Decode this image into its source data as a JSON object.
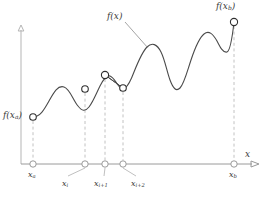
{
  "figure": {
    "name": "function-sampling-diagram",
    "background": "#ffffff",
    "curve_color": "#4a4a4a",
    "axis_color": "#9a9a9a",
    "dash_color": "#c2c2c2",
    "label_color": "#3a3a3a",
    "marker_fill": "#ffffff"
  },
  "axes": {
    "x_axis_label": "x",
    "y_axis_label": "",
    "x_axis_y": 164,
    "y_axis_x": 21,
    "x_axis_from": 21,
    "x_axis_to": 259,
    "y_axis_from": 164,
    "y_axis_to": 28
  },
  "labels": {
    "f_start": "f(x",
    "f_start_sub": "a",
    "f_start_close": ")",
    "f_curve": "f(x)",
    "f_end": "f(x",
    "f_end_sub": "b",
    "f_end_close": ")",
    "x_axis": "x"
  },
  "ticks": [
    {
      "id": "x-a",
      "base": "x",
      "sub": "a",
      "x": 33,
      "label_x": 27,
      "label_y": 172,
      "leader": false
    },
    {
      "id": "x-i",
      "base": "x",
      "sub": "i",
      "x": 85,
      "label_x": 64,
      "label_y": 182,
      "leader": true,
      "leader_x2": 68,
      "leader_y2": 176
    },
    {
      "id": "x-i-p1",
      "base": "x",
      "sub": "i+1",
      "x": 105,
      "label_x": 98,
      "label_y": 182,
      "leader": true,
      "leader_x2": 104,
      "leader_y2": 176
    },
    {
      "id": "x-i-p2",
      "base": "x",
      "sub": "i+2",
      "x": 123,
      "label_x": 131,
      "label_y": 182,
      "leader": true,
      "leader_x2": 136,
      "leader_y2": 176
    },
    {
      "id": "x-b",
      "base": "x",
      "sub": "b",
      "x": 234,
      "label_x": 228,
      "label_y": 172,
      "leader": false
    }
  ],
  "sample_points": [
    {
      "id": "p-a",
      "x": 33,
      "y": 117
    },
    {
      "id": "p-i",
      "x": 85,
      "y": 89
    },
    {
      "id": "p-i-p1",
      "x": 105,
      "y": 75
    },
    {
      "id": "p-i-p2",
      "x": 123,
      "y": 88
    },
    {
      "id": "p-b",
      "x": 234,
      "y": 22
    }
  ],
  "chart_data": {
    "type": "line",
    "title": "f(x)",
    "xlabel": "x",
    "ylabel": "",
    "x": [
      33,
      85,
      105,
      123,
      234
    ],
    "x_tick_labels": [
      "x_a",
      "x_i",
      "x_{i+1}",
      "x_{i+2}",
      "x_b"
    ],
    "y": [
      117,
      89,
      75,
      88,
      22
    ],
    "note": "Screen-pixel coordinates; smaller y is higher on the plot.",
    "curve_path": "M 33 117 C 40 117 44 110 49 101 C 54 92 58 85 64 87 C 70 89 73 100 78 106 C 82 111 85 112 89 107 C 93 102 96 94 100 86 C 103 80 106 75 110 76 C 113 77 115 81 118 85 C 120 88 122 90 125 88 C 128 86 131 80 134 72 C 138 62 142 52 147 47 C 152 42 157 44 161 52 C 165 60 167 72 170 80 C 173 88 176 92 180 88 C 184 84 187 72 191 60 C 195 48 199 38 204 34 C 209 30 213 34 217 41 C 220 47 223 53 227 52 C 230 51 232 40 234 22",
    "chords": [
      [
        85,
        89,
        105,
        75
      ],
      [
        105,
        75,
        123,
        88
      ]
    ],
    "drop_lines": [
      {
        "x": 33,
        "y_top": 117,
        "y_bottom": 164
      },
      {
        "x": 85,
        "y_top": 89,
        "y_bottom": 164
      },
      {
        "x": 105,
        "y_top": 75,
        "y_bottom": 164
      },
      {
        "x": 123,
        "y_top": 88,
        "y_bottom": 164
      },
      {
        "x": 234,
        "y_top": 22,
        "y_bottom": 164
      }
    ],
    "leader": {
      "from_x": 125,
      "from_y": 22,
      "to_x": 148,
      "to_y": 48,
      "label": "f(x)"
    },
    "grid": false,
    "legend": "none"
  }
}
